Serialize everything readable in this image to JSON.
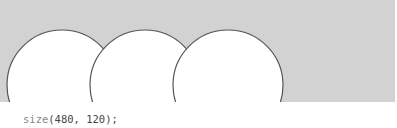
{
  "sketch": {
    "canvas_color": "#d2d2d2",
    "circles": [
      {
        "cx": 62,
        "cy": 85,
        "r": 55
      },
      {
        "cx": 145,
        "cy": 85,
        "r": 55
      },
      {
        "cx": 228,
        "cy": 85,
        "r": 55
      }
    ]
  },
  "code": {
    "function_name": "size",
    "arguments": "(480, 120);"
  }
}
